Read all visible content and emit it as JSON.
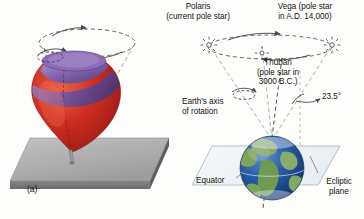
{
  "figure": {
    "panel_label": "(a)",
    "background_color": "#fdfdfb",
    "labels": {
      "polaris": "Polaris\n(current pole star)",
      "vega": "Vega (pole star\nin A.D. 14,000)",
      "thuban": "Thuban\n(pole star in\n3000 B.C.)",
      "tilt_angle": "23.5°",
      "earth_axis": "Earth's axis\nof rotation",
      "equator": "Equator",
      "ecliptic_plane": "Ecliptic\nplane"
    },
    "colors": {
      "top_body_red": "#c0241d",
      "top_band_purple": "#7b5ba6",
      "slab_gray": "#a8a8a8",
      "slab_edge_gray": "#6f6f6f",
      "earth_ocean_blue": "#1f4f96",
      "earth_land_green": "#7fa35a",
      "ecliptic_fill": "#eef2f6",
      "line_gray": "#5a5a5a",
      "text": "#141414"
    },
    "icons": {
      "polaris_star": "star-burst-icon",
      "thuban_star": "small-star-icon",
      "vega_star": "star-burst-icon",
      "top_spin_arrow": "rotation-arrow-icon",
      "earth_spin_arrow": "rotation-arrow-icon",
      "precession_arrow_top": "precession-arrow-icon",
      "precession_arrow_right": "precession-arrow-icon",
      "tilt_pointer": "angle-pointer-icon",
      "equator_leader": "leader-line-icon",
      "ecliptic_leader": "leader-line-icon"
    },
    "panels": {
      "left": "spinning-top-precession",
      "right": "earth-axial-precession"
    }
  }
}
